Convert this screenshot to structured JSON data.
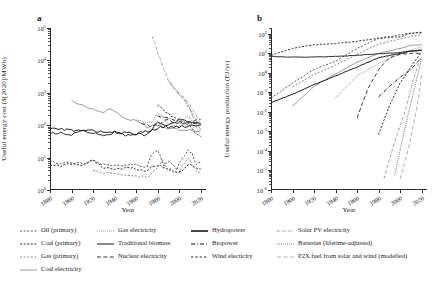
{
  "figure": {
    "panels": [
      {
        "letter": "a",
        "ylabel": "Useful energy cost ($[2020]/MWh)",
        "xlabel": "Year"
      },
      {
        "letter": "b",
        "ylabel": "Useful energy production (EJ/yr)",
        "xlabel": "Year"
      }
    ]
  },
  "axes": {
    "x_ticks": [
      "1880",
      "1900",
      "1920",
      "1940",
      "1960",
      "1980",
      "2000",
      "2020"
    ],
    "panel_a_y_ticks": [
      "10",
      "10",
      "10",
      "10",
      "10",
      "10"
    ],
    "panel_a_y_exponents": [
      "0",
      "1",
      "2",
      "3",
      "4",
      "5"
    ],
    "panel_b_y_ticks": [
      "10",
      "10",
      "10",
      "10",
      "10",
      "10",
      "10",
      "10",
      "10"
    ],
    "panel_b_y_exponents": [
      "-6",
      "-5",
      "-4",
      "-3",
      "-2",
      "-1",
      "0",
      "1",
      "2"
    ]
  },
  "legend": {
    "columns": [
      {
        "items": [
          {
            "label": "Oil (primary)",
            "style": "dashed-short",
            "color": "#5a5a5a",
            "width": 1.0
          },
          {
            "label": "Coal (primary)",
            "style": "dashed-short",
            "color": "#2b2b2b",
            "width": 1.0
          },
          {
            "label": "Gas (primary)",
            "style": "dashed-short",
            "color": "#8c8c8c",
            "width": 1.0
          },
          {
            "label": "Coal electricity",
            "style": "solid",
            "color": "#9a9a9a",
            "width": 1.0
          }
        ]
      },
      {
        "items": [
          {
            "label": "Gas electricity",
            "style": "dotted",
            "color": "#6e6e6e",
            "width": 1.0
          },
          {
            "label": "Traditional biomass",
            "style": "solid",
            "color": "#2b2b2b",
            "width": 1.1
          },
          {
            "label": "Nuclear electricity",
            "style": "dashed-long",
            "color": "#3a3a3a",
            "width": 1.0
          }
        ]
      },
      {
        "items": [
          {
            "label": "Hydropower",
            "style": "solid",
            "color": "#1a1a1a",
            "width": 1.6
          },
          {
            "label": "Biopower",
            "style": "dashdot",
            "color": "#1a1a1a",
            "width": 1.2
          },
          {
            "label": "Wind electicity",
            "style": "dashed-short",
            "color": "#2b2b2b",
            "width": 1.2
          }
        ]
      },
      {
        "items": [
          {
            "label": "Solar PV electricity",
            "style": "dashdot-fine",
            "color": "#9a9a9a",
            "width": 1.0
          },
          {
            "label": "Batteries (lifetime-adjusted)",
            "style": "dotted",
            "color": "#4a4a4a",
            "width": 1.0
          },
          {
            "label": "P2X fuel from solar and wind (modelled)",
            "style": "dashed-long",
            "color": "#b0b0b0",
            "width": 1.0
          }
        ]
      }
    ]
  },
  "chart_data": [
    {
      "type": "line",
      "title": "a",
      "xlabel": "Year",
      "ylabel": "Useful energy cost ($[2020]/MWh)",
      "xlim": [
        1880,
        2025
      ],
      "ylim": [
        1,
        100000
      ],
      "yscale": "log",
      "xscale": "linear",
      "grid": false,
      "legend_position": "below-figure",
      "series": [
        {
          "name": "Oil (primary)",
          "style": "dashed-short",
          "color": "#5a5a5a",
          "x": [
            1880,
            1890,
            1900,
            1910,
            1920,
            1930,
            1940,
            1950,
            1960,
            1970,
            1974,
            1980,
            1986,
            1990,
            1998,
            2000,
            2008,
            2012,
            2016,
            2020
          ],
          "y": [
            7.5,
            6.5,
            7.0,
            6.2,
            8.0,
            6.0,
            5.5,
            6.0,
            6.2,
            5.0,
            12.0,
            16.0,
            6.0,
            8.0,
            4.5,
            7.0,
            16.0,
            14.0,
            6.0,
            7.0
          ]
        },
        {
          "name": "Coal (primary)",
          "style": "dashed-short",
          "color": "#2b2b2b",
          "x": [
            1880,
            1890,
            1900,
            1910,
            1920,
            1930,
            1940,
            1950,
            1960,
            1970,
            1980,
            1990,
            2000,
            2010,
            2020
          ],
          "y": [
            6.0,
            5.5,
            6.5,
            5.8,
            8.5,
            5.0,
            4.5,
            4.8,
            4.5,
            4.0,
            6.0,
            4.5,
            3.5,
            6.0,
            4.5
          ]
        },
        {
          "name": "Gas (primary)",
          "style": "dashed-short",
          "color": "#8c8c8c",
          "x": [
            1920,
            1930,
            1940,
            1950,
            1960,
            1970,
            1980,
            1985,
            1990,
            2000,
            2005,
            2008,
            2012,
            2016,
            2020
          ],
          "y": [
            4.0,
            3.5,
            3.0,
            2.6,
            2.8,
            2.4,
            5.0,
            8.0,
            4.0,
            3.5,
            7.0,
            10.0,
            6.0,
            4.0,
            3.0
          ]
        },
        {
          "name": "Coal electricity",
          "style": "solid",
          "color": "#9a9a9a",
          "x": [
            1900,
            1910,
            1920,
            1930,
            1935,
            1940,
            1950,
            1960,
            1970,
            1980,
            1990,
            2000,
            2010,
            2020
          ],
          "y": [
            600,
            420,
            300,
            250,
            330,
            260,
            170,
            130,
            90,
            95,
            80,
            75,
            70,
            68
          ]
        },
        {
          "name": "Gas electricity",
          "style": "dotted",
          "color": "#6e6e6e",
          "x": [
            1960,
            1970,
            1975,
            1980,
            1985,
            1990,
            1995,
            2000,
            2005,
            2008,
            2012,
            2016,
            2020
          ],
          "y": [
            150,
            110,
            130,
            220,
            180,
            120,
            100,
            95,
            150,
            200,
            140,
            95,
            80
          ]
        },
        {
          "name": "Traditional biomass",
          "style": "solid",
          "color": "#2b2b2b",
          "x": [
            1880,
            1890,
            1900,
            1910,
            1920,
            1930,
            1940,
            1950,
            1960,
            1970,
            1980,
            1990,
            2000,
            2010,
            2020
          ],
          "y": [
            55,
            60,
            52,
            70,
            58,
            45,
            62,
            48,
            55,
            50,
            120,
            95,
            150,
            130,
            110
          ]
        },
        {
          "name": "Nuclear electricity",
          "style": "dashed-long",
          "color": "#3a3a3a",
          "x": [
            1965,
            1970,
            1975,
            1980,
            1985,
            1990,
            1995,
            2000,
            2005,
            2010,
            2015,
            2020
          ],
          "y": [
            120,
            100,
            95,
            110,
            130,
            140,
            120,
            110,
            115,
            125,
            140,
            150
          ]
        },
        {
          "name": "Hydropower",
          "style": "solid",
          "color": "#1a1a1a",
          "x": [
            1880,
            1900,
            1920,
            1940,
            1960,
            1975,
            1985,
            1995,
            2005,
            2015,
            2020
          ],
          "y": [
            80,
            70,
            65,
            60,
            55,
            70,
            90,
            85,
            95,
            100,
            105
          ]
        },
        {
          "name": "Biopower",
          "style": "dashdot",
          "color": "#1a1a1a",
          "x": [
            1980,
            1985,
            1990,
            1995,
            2000,
            2005,
            2010,
            2015,
            2020
          ],
          "y": [
            210,
            180,
            160,
            140,
            130,
            120,
            115,
            105,
            100
          ]
        },
        {
          "name": "Wind electicity",
          "style": "dashed-short",
          "color": "#2b2b2b",
          "x": [
            1980,
            1985,
            1990,
            1995,
            2000,
            2005,
            2010,
            2015,
            2020
          ],
          "y": [
            450,
            300,
            220,
            170,
            140,
            120,
            90,
            60,
            45
          ]
        },
        {
          "name": "Solar PV electricity",
          "style": "dashdot-fine",
          "color": "#9a9a9a",
          "x": [
            1975,
            1980,
            1985,
            1990,
            1995,
            2000,
            2005,
            2010,
            2015,
            2020
          ],
          "y": [
            60000,
            18000,
            6000,
            2500,
            1400,
            900,
            600,
            300,
            110,
            50
          ]
        },
        {
          "name": "Batteries (lifetime-adjusted)",
          "style": "dotted",
          "color": "#4a4a4a",
          "x": [
            1992,
            1996,
            2000,
            2005,
            2010,
            2015,
            2020
          ],
          "y": [
            2000,
            1300,
            900,
            600,
            350,
            160,
            70
          ]
        },
        {
          "name": "P2X fuel from solar and wind (modelled)",
          "style": "dashed-long",
          "color": "#b0b0b0",
          "x": [
            1990,
            1995,
            2000,
            2005,
            2010,
            2015,
            2020
          ],
          "y": [
            2200,
            1500,
            1000,
            700,
            420,
            230,
            120
          ]
        }
      ]
    },
    {
      "type": "line",
      "title": "b",
      "xlabel": "Year",
      "ylabel": "Useful energy production (EJ/yr)",
      "xlim": [
        1880,
        2025
      ],
      "ylim": [
        1e-06,
        200
      ],
      "yscale": "log",
      "xscale": "linear",
      "grid": false,
      "legend_position": "below-figure",
      "series": [
        {
          "name": "Oil (primary)",
          "style": "dashed-short",
          "color": "#5a5a5a",
          "x": [
            1880,
            1900,
            1920,
            1940,
            1960,
            1980,
            2000,
            2010,
            2020
          ],
          "y": [
            0.05,
            0.3,
            1.5,
            4.0,
            18.0,
            60.0,
            90.0,
            110.0,
            120.0
          ]
        },
        {
          "name": "Coal (primary)",
          "style": "dashed-short",
          "color": "#2b2b2b",
          "x": [
            1880,
            1900,
            1920,
            1940,
            1960,
            1980,
            2000,
            2010,
            2020
          ],
          "y": [
            8.0,
            18.0,
            28.0,
            32.0,
            42.0,
            60.0,
            70.0,
            110.0,
            115.0
          ]
        },
        {
          "name": "Gas (primary)",
          "style": "dashed-short",
          "color": "#8c8c8c",
          "x": [
            1900,
            1920,
            1940,
            1960,
            1980,
            2000,
            2010,
            2020
          ],
          "y": [
            0.2,
            0.8,
            2.5,
            9.0,
            30.0,
            55.0,
            75.0,
            90.0
          ]
        },
        {
          "name": "Coal electricity",
          "style": "solid",
          "color": "#9a9a9a",
          "x": [
            1900,
            1920,
            1940,
            1960,
            1980,
            2000,
            2010,
            2020
          ],
          "y": [
            0.02,
            0.2,
            0.9,
            3.5,
            10.0,
            18.0,
            26.0,
            28.0
          ]
        },
        {
          "name": "Gas electricity",
          "style": "dotted",
          "color": "#6e6e6e",
          "x": [
            1940,
            1960,
            1980,
            2000,
            2010,
            2020
          ],
          "y": [
            0.05,
            0.7,
            3.0,
            9.0,
            15.0,
            22.0
          ]
        },
        {
          "name": "Traditional biomass",
          "style": "solid",
          "color": "#2b2b2b",
          "x": [
            1880,
            1900,
            1920,
            1940,
            1960,
            1980,
            2000,
            2010,
            2020
          ],
          "y": [
            7.0,
            6.5,
            6.5,
            7.0,
            8.0,
            9.5,
            11.0,
            13.0,
            14.0
          ]
        },
        {
          "name": "Nuclear electricity",
          "style": "dashed-long",
          "color": "#3a3a3a",
          "x": [
            1960,
            1970,
            1980,
            1990,
            2000,
            2010,
            2020
          ],
          "y": [
            0.005,
            0.15,
            1.5,
            6.0,
            9.0,
            10.0,
            10.0
          ]
        },
        {
          "name": "Hydropower",
          "style": "solid",
          "color": "#1a1a1a",
          "x": [
            1880,
            1900,
            1920,
            1940,
            1960,
            1980,
            2000,
            2010,
            2020
          ],
          "y": [
            0.03,
            0.08,
            0.25,
            0.7,
            2.0,
            6.0,
            10.0,
            13.0,
            15.0
          ]
        },
        {
          "name": "Biopower",
          "style": "dashdot",
          "color": "#1a1a1a",
          "x": [
            1980,
            1990,
            2000,
            2010,
            2015,
            2020
          ],
          "y": [
            0.06,
            0.2,
            0.6,
            1.5,
            3.0,
            6.0
          ]
        },
        {
          "name": "Wind electicity",
          "style": "dashed-short",
          "color": "#2b2b2b",
          "x": [
            1980,
            1990,
            2000,
            2010,
            2015,
            2020
          ],
          "y": [
            0.0007,
            0.02,
            0.3,
            2.0,
            5.0,
            12.0
          ]
        },
        {
          "name": "Solar PV electricity",
          "style": "dashdot-fine",
          "color": "#9a9a9a",
          "x": [
            1985,
            1995,
            2005,
            2012,
            2016,
            2020
          ],
          "y": [
            4e-06,
            0.0003,
            0.012,
            0.4,
            2.0,
            8.0
          ]
        },
        {
          "name": "Batteries (lifetime-adjusted)",
          "style": "dotted",
          "color": "#4a4a4a",
          "x": [
            1995,
            2005,
            2012,
            2016,
            2020
          ],
          "y": [
            6e-06,
            0.002,
            0.08,
            0.7,
            5.0
          ]
        },
        {
          "name": "P2X fuel from solar and wind (modelled)",
          "style": "dashed-long",
          "color": "#b0b0b0",
          "x": [
            2000,
            2008,
            2014,
            2018,
            2020
          ],
          "y": [
            3.5e-06,
            0.00015,
            0.006,
            0.1,
            0.9
          ]
        }
      ]
    }
  ]
}
